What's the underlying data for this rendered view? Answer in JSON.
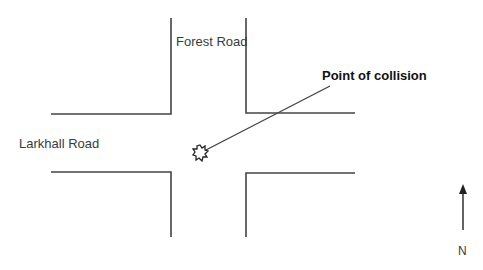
{
  "diagram": {
    "roads": {
      "vertical": "Forest Road",
      "horizontal": "Larkhall Road"
    },
    "annotation": "Point of collision",
    "compass": "N",
    "colors": {
      "line": "#444444",
      "text": "#3a3a3a"
    }
  }
}
